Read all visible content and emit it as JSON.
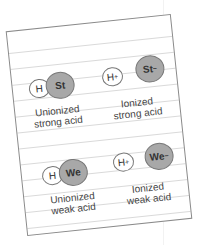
{
  "colors": {
    "paper": "#ffffff",
    "rule_lines": "#d9d9d9",
    "border": "#8a8a8a",
    "anion_fill": "#a8a8a8",
    "proton_fill": "#ffffff",
    "text": "#444444"
  },
  "groups": [
    {
      "id": "unionized-strong",
      "h": "H",
      "x": "St",
      "label_line1": "Unionized",
      "label_line2": "strong acid",
      "ionized": false
    },
    {
      "id": "ionized-strong",
      "h": "H",
      "h_charge": "+",
      "x": "St",
      "x_charge": "−",
      "label_line1": "Ionized",
      "label_line2": "strong acid",
      "ionized": true
    },
    {
      "id": "unionized-weak",
      "h": "H",
      "x": "We",
      "label_line1": "Unionized",
      "label_line2": "weak acid",
      "ionized": false
    },
    {
      "id": "ionized-weak",
      "h": "H",
      "h_charge": "+",
      "x": "We",
      "x_charge": "−",
      "label_line1": "Ionized",
      "label_line2": "weak acid",
      "ionized": true
    }
  ]
}
